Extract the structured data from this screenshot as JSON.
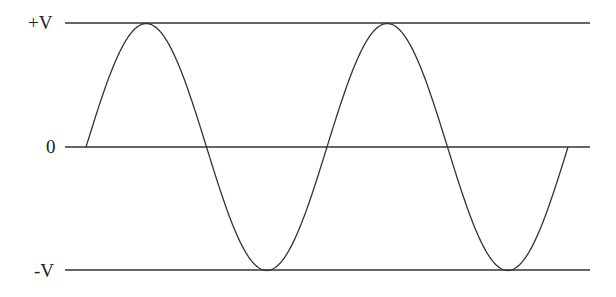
{
  "diagram": {
    "type": "sine-waveform",
    "labels": {
      "positive_peak": "+V",
      "zero": "0",
      "negative_peak": "-V"
    },
    "colors": {
      "line": "#333333",
      "text": "#222222",
      "background": "#ffffff"
    },
    "cycles": 2
  },
  "chart_data": {
    "type": "line",
    "title": "",
    "xlabel": "",
    "ylabel": "",
    "y_ticks": [
      "+V",
      "0",
      "-V"
    ],
    "ylim": [
      -1,
      1
    ],
    "series": [
      {
        "name": "sine wave",
        "function": "sin(x)",
        "x_range_periods": [
          0,
          2
        ],
        "values_at_quarter_periods": [
          0,
          1,
          0,
          -1,
          0,
          1,
          0,
          -1,
          0
        ]
      }
    ],
    "reference_lines": [
      1,
      0,
      -1
    ],
    "grid": false,
    "legend": null
  }
}
